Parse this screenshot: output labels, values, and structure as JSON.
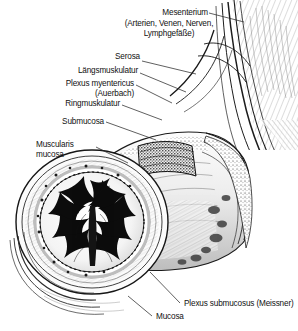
{
  "figure": {
    "background_color": "#ffffff",
    "ink_color": "#111111",
    "style": "pen-and-ink anatomical engraving, greyscale"
  },
  "labels": {
    "mesenterium": "Mesenterium",
    "mesenterium_sub_line1": "(Arterien, Venen, Nerven,",
    "mesenterium_sub_line2": "Lymphgefäße)",
    "serosa": "Serosa",
    "laengsmuskulatur": "Längsmuskulatur",
    "plexus_myentericus": "Plexus myentericus",
    "plexus_myentericus_sub": "(Auerbach)",
    "ringmuskulatur": "Ringmuskulatur",
    "submucosa": "Submucosa",
    "muscularis_line1": "Muscularis",
    "muscularis_line2": "mucosa",
    "plexus_submucosus": "Plexus submucosus (Meissner)",
    "mucosa": "Mucosa"
  },
  "icons": {
    "leader_line": "leader-line-icon",
    "intestine": "intestine-cross-section-icon",
    "mesentery_fan": "mesentery-fan-icon"
  }
}
